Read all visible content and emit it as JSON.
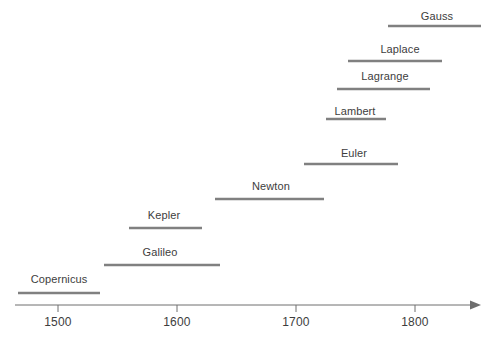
{
  "chart_data": {
    "type": "timeline",
    "title": "",
    "subtitle": "",
    "xlabel": "",
    "ylabel": "",
    "xlim": [
      1455,
      1860
    ],
    "grid": false,
    "legend": null,
    "axis": {
      "ticks": [
        1500,
        1600,
        1700,
        1800
      ],
      "tick_labels": [
        "1500",
        "1600",
        "1700",
        "1800"
      ],
      "arrow_end": true,
      "line_color": "#6e6e6e",
      "tick_color": "#6e6e6e"
    },
    "bar_color": "#808080",
    "label_color": "#3d3d3d",
    "series": [
      {
        "name": "Copernicus",
        "label": "Copernicus",
        "start": 1473,
        "end": 1543,
        "px": {
          "x1": 18,
          "x2": 100,
          "y": 293,
          "label_x": 59,
          "label_y": 273
        }
      },
      {
        "name": "Galileo",
        "label": "Galileo",
        "start": 1564,
        "end": 1642,
        "px": {
          "x1": 104,
          "x2": 220,
          "y": 265,
          "label_x": 160,
          "label_y": 246
        }
      },
      {
        "name": "Kepler",
        "label": "Kepler",
        "start": 1571,
        "end": 1630,
        "px": {
          "x1": 129,
          "x2": 202,
          "y": 228,
          "label_x": 164,
          "label_y": 209
        }
      },
      {
        "name": "Newton",
        "label": "Newton",
        "start": 1643,
        "end": 1727,
        "px": {
          "x1": 215,
          "x2": 324,
          "y": 199,
          "label_x": 271,
          "label_y": 180
        }
      },
      {
        "name": "Euler",
        "label": "Euler",
        "start": 1707,
        "end": 1783,
        "px": {
          "x1": 304,
          "x2": 398,
          "y": 164,
          "label_x": 354,
          "label_y": 147
        }
      },
      {
        "name": "Lambert",
        "label": "Lambert",
        "start": 1728,
        "end": 1777,
        "px": {
          "x1": 326,
          "x2": 386,
          "y": 119,
          "label_x": 355,
          "label_y": 105
        }
      },
      {
        "name": "Lagrange",
        "label": "Lagrange",
        "start": 1736,
        "end": 1813,
        "px": {
          "x1": 337,
          "x2": 430,
          "y": 89,
          "label_x": 385,
          "label_y": 70
        }
      },
      {
        "name": "Laplace",
        "label": "Laplace",
        "start": 1749,
        "end": 1827,
        "px": {
          "x1": 348,
          "x2": 442,
          "y": 61,
          "label_x": 400,
          "label_y": 43
        }
      },
      {
        "name": "Gauss",
        "label": "Gauss",
        "start": 1777,
        "end": 1855,
        "px": {
          "x1": 388,
          "x2": 481,
          "y": 26,
          "label_x": 437,
          "label_y": 10
        }
      }
    ]
  }
}
